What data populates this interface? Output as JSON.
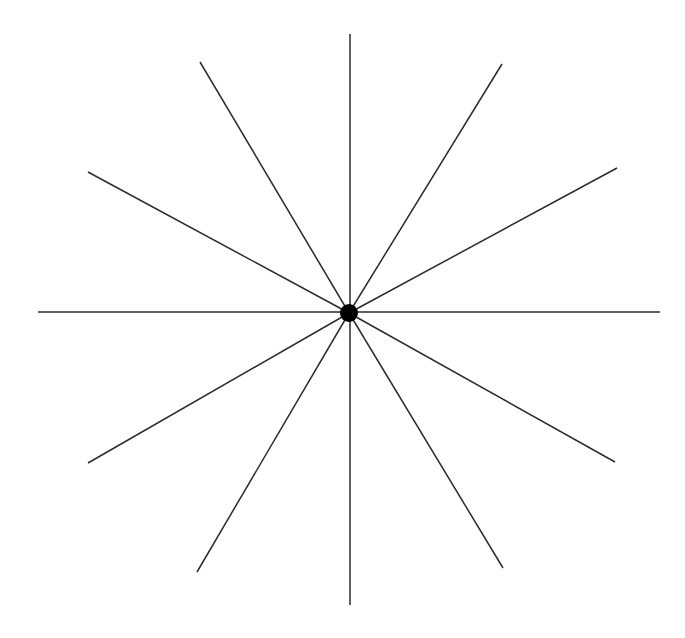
{
  "canvas": {
    "width": 685,
    "height": 638,
    "background_color": "#ffffff",
    "title": "Radial spoke figure"
  },
  "chart_data": {
    "type": "scatter",
    "title": "",
    "subtitle": "",
    "xlabel": "",
    "ylabel": "",
    "grid": false,
    "legend_position": "none",
    "axis_ranges": {
      "x": [
        0,
        685
      ],
      "y": [
        0,
        638
      ]
    },
    "center": {
      "x": 349,
      "y": 313,
      "dot_radius": 9,
      "dot_color": "#000000",
      "label": "hub"
    },
    "line_style": {
      "color": "#2b2b2b",
      "width": 1.5,
      "cap": "butt"
    },
    "spoke_count": 10,
    "diameter_count": 5,
    "angular_spacing_degrees": 36,
    "spokes": [
      {
        "name": "north",
        "angle_degrees": 90,
        "x1": 350,
        "y1": 313,
        "x2": 350,
        "y2": 34,
        "length": 279
      },
      {
        "name": "north-northeast",
        "angle_degrees": 54,
        "x1": 349,
        "y1": 313,
        "x2": 502,
        "y2": 64,
        "length": 292
      },
      {
        "name": "east-northeast",
        "angle_degrees": 18,
        "x1": 349,
        "y1": 313,
        "x2": 617,
        "y2": 168,
        "length": 305
      },
      {
        "name": "east",
        "angle_degrees": 0,
        "x1": 349,
        "y1": 312,
        "x2": 660,
        "y2": 312,
        "length": 311
      },
      {
        "name": "east-southeast",
        "angle_degrees": -18,
        "x1": 349,
        "y1": 313,
        "x2": 615,
        "y2": 462,
        "length": 305
      },
      {
        "name": "south-southeast",
        "angle_degrees": -54,
        "x1": 349,
        "y1": 313,
        "x2": 503,
        "y2": 568,
        "length": 298
      },
      {
        "name": "south",
        "angle_degrees": -90,
        "x1": 350,
        "y1": 313,
        "x2": 350,
        "y2": 605,
        "length": 292
      },
      {
        "name": "south-southwest",
        "angle_degrees": -126,
        "x1": 349,
        "y1": 313,
        "x2": 197,
        "y2": 572,
        "length": 300
      },
      {
        "name": "west-southwest",
        "angle_degrees": -162,
        "x1": 349,
        "y1": 313,
        "x2": 88,
        "y2": 463,
        "length": 301
      },
      {
        "name": "west",
        "angle_degrees": 180,
        "x1": 349,
        "y1": 312,
        "x2": 38,
        "y2": 312,
        "length": 311
      },
      {
        "name": "west-northwest",
        "angle_degrees": 162,
        "x1": 349,
        "y1": 313,
        "x2": 88,
        "y2": 172,
        "length": 297
      },
      {
        "name": "north-northwest",
        "angle_degrees": 126,
        "x1": 349,
        "y1": 313,
        "x2": 200,
        "y2": 62,
        "length": 292
      }
    ]
  }
}
